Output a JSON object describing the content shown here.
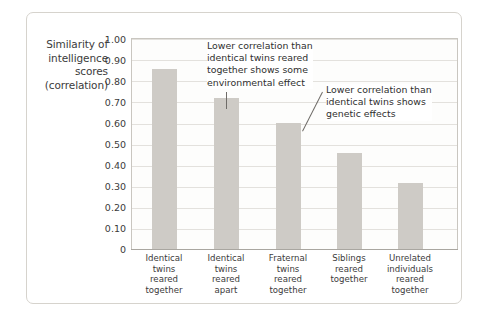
{
  "figure": {
    "y_axis_title_lines": [
      "Similarity of",
      "intelligence",
      "scores",
      "(correlation)"
    ],
    "annotations": [
      {
        "id": "environmental-effect",
        "lines": [
          "Lower correlation than",
          "identical twins reared",
          "together shows some",
          "environmental effect"
        ]
      },
      {
        "id": "genetic-effect",
        "lines": [
          "Lower correlation than",
          "identical twins shows",
          "genetic effects"
        ]
      }
    ],
    "colors": {
      "bar": "#cecbc6",
      "gridline": "#e3e1dd",
      "axis": "#a9a6a0",
      "text": "#3b3b3b",
      "frame": "#d6d3cd",
      "plot_background": "#fdfdfc"
    }
  },
  "chart_data": {
    "type": "bar",
    "title": "",
    "xlabel": "",
    "ylabel": "Similarity of intelligence scores (correlation)",
    "ylim": [
      0,
      1.0
    ],
    "ytick_labels": [
      "1.00",
      "0.90",
      "0.80",
      "0.70",
      "0.60",
      "0.50",
      "0.40",
      "0.30",
      "0.20",
      "0.10",
      "0"
    ],
    "ytick_values": [
      1.0,
      0.9,
      0.8,
      0.7,
      0.6,
      0.5,
      0.4,
      0.3,
      0.2,
      0.1,
      0
    ],
    "grid": true,
    "legend": "none",
    "categories": [
      "Identical twins reared together",
      "Identical twins reared apart",
      "Fraternal twins reared together",
      "Siblings reared together",
      "Unrelated individuals reared together"
    ],
    "category_label_lines": [
      [
        "Identical",
        "twins",
        "reared",
        "together"
      ],
      [
        "Identical",
        "twins",
        "reared",
        "apart"
      ],
      [
        "Fraternal",
        "twins",
        "reared",
        "together"
      ],
      [
        "Siblings",
        "reared",
        "together"
      ],
      [
        "Unrelated",
        "individuals",
        "reared",
        "together"
      ]
    ],
    "values": [
      0.86,
      0.72,
      0.6,
      0.46,
      0.32
    ],
    "annotations": [
      {
        "text": "Lower correlation than identical twins reared together shows some environmental effect",
        "points_to_category": "Identical twins reared apart"
      },
      {
        "text": "Lower correlation than identical twins shows genetic effects",
        "points_to_category": "Fraternal twins reared together"
      }
    ]
  }
}
